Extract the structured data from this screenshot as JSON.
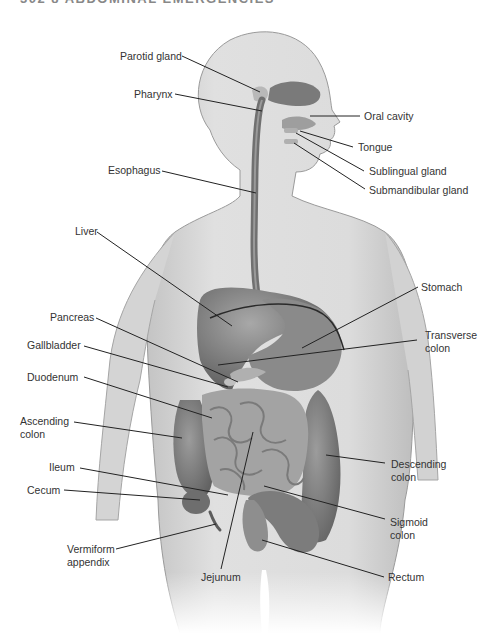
{
  "page_header": "302   8   ABDOMINAL EMERGENCIES",
  "figure": {
    "colors": {
      "skin": "#d9d9d9",
      "skin_edge": "#9a9a9a",
      "organ_dark": "#6e6e6e",
      "organ_mid": "#8c8c8c",
      "organ_light": "#b3b3b3",
      "leader_line": "#222222",
      "label_text": "#333333"
    },
    "labels": [
      {
        "id": "parotid-gland",
        "text": "Parotid gland",
        "side": "left"
      },
      {
        "id": "pharynx",
        "text": "Pharynx",
        "side": "left"
      },
      {
        "id": "oral-cavity",
        "text": "Oral cavity",
        "side": "right"
      },
      {
        "id": "tongue",
        "text": "Tongue",
        "side": "right"
      },
      {
        "id": "sublingual-gland",
        "text": "Sublingual gland",
        "side": "right"
      },
      {
        "id": "submandibular-gland",
        "text": "Submandibular gland",
        "side": "right"
      },
      {
        "id": "esophagus",
        "text": "Esophagus",
        "side": "left"
      },
      {
        "id": "liver",
        "text": "Liver",
        "side": "left"
      },
      {
        "id": "stomach",
        "text": "Stomach",
        "side": "right"
      },
      {
        "id": "pancreas",
        "text": "Pancreas",
        "side": "left"
      },
      {
        "id": "transverse-colon",
        "text": "Transverse\ncolon",
        "side": "right"
      },
      {
        "id": "gallbladder",
        "text": "Gallbladder",
        "side": "left"
      },
      {
        "id": "duodenum",
        "text": "Duodenum",
        "side": "left"
      },
      {
        "id": "ascending-colon",
        "text": "Ascending\ncolon",
        "side": "left"
      },
      {
        "id": "ileum",
        "text": "Ileum",
        "side": "left"
      },
      {
        "id": "descending-colon",
        "text": "Descending\ncolon",
        "side": "right"
      },
      {
        "id": "cecum",
        "text": "Cecum",
        "side": "left"
      },
      {
        "id": "sigmoid-colon",
        "text": "Sigmoid\ncolon",
        "side": "right"
      },
      {
        "id": "vermiform-appendix",
        "text": "Vermiform\nappendix",
        "side": "left"
      },
      {
        "id": "jejunum",
        "text": "Jejunum",
        "side": "bottom"
      },
      {
        "id": "rectum",
        "text": "Rectum",
        "side": "right"
      }
    ]
  }
}
